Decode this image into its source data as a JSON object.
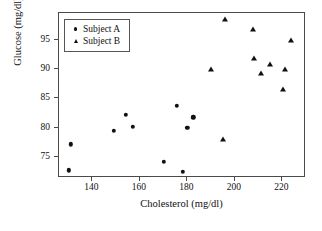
{
  "chart_data": {
    "type": "scatter",
    "title": "",
    "xlabel": "Cholesterol (mg/dl)",
    "ylabel": "Glucose (mg/dl)",
    "xlim": [
      126,
      230
    ],
    "ylim": [
      71.5,
      99.5
    ],
    "xticks": [
      140,
      160,
      180,
      200,
      220
    ],
    "xtick_labels": [
      "140",
      "160",
      "180",
      "200",
      "220"
    ],
    "yticks": [
      75,
      80,
      85,
      90,
      95
    ],
    "ytick_labels": [
      "75",
      "80",
      "85",
      "90",
      "95"
    ],
    "grid": false,
    "legend_position": "upper left",
    "series": [
      {
        "name": "Subject A",
        "marker": "circle",
        "color": "#111111",
        "points": [
          {
            "x": 131,
            "y": 77.2
          },
          {
            "x": 130,
            "y": 72.8
          },
          {
            "x": 149,
            "y": 79.5
          },
          {
            "x": 154,
            "y": 82.2
          },
          {
            "x": 157,
            "y": 80.2
          },
          {
            "x": 170,
            "y": 74.2
          },
          {
            "x": 175.5,
            "y": 83.8
          },
          {
            "x": 178,
            "y": 72.5
          },
          {
            "x": 180,
            "y": 80.0
          },
          {
            "x": 182.5,
            "y": 81.8
          }
        ]
      },
      {
        "name": "Subject B",
        "marker": "triangle",
        "color": "#111111",
        "points": [
          {
            "x": 190,
            "y": 90.0
          },
          {
            "x": 195,
            "y": 78.2
          },
          {
            "x": 196,
            "y": 98.4
          },
          {
            "x": 207.5,
            "y": 96.8
          },
          {
            "x": 208,
            "y": 91.9
          },
          {
            "x": 211,
            "y": 89.3
          },
          {
            "x": 215,
            "y": 90.9
          },
          {
            "x": 220.5,
            "y": 86.6
          },
          {
            "x": 221,
            "y": 90.0
          },
          {
            "x": 223.5,
            "y": 95.0
          }
        ]
      }
    ]
  },
  "legend": {
    "items": [
      {
        "label": "Subject A",
        "marker": "circle"
      },
      {
        "label": "Subject B",
        "marker": "triangle"
      }
    ]
  }
}
